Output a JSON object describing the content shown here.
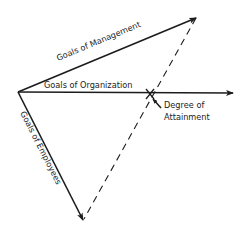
{
  "diagram": {
    "labels": {
      "management": "Goals of Management",
      "organization": "Goals of Organization",
      "employees": "Goals of Employees",
      "attainment_line1": "Degree of",
      "attainment_line2": "Attainment"
    },
    "colors": {
      "ink": "#1c1c1c",
      "background": "#ffffff"
    },
    "points": {
      "origin": [
        18,
        92
      ],
      "management_tip": [
        197,
        17
      ],
      "organization_tip": [
        234,
        93
      ],
      "employees_tip": [
        84,
        221
      ],
      "attainment_mark": [
        150,
        94
      ]
    }
  }
}
